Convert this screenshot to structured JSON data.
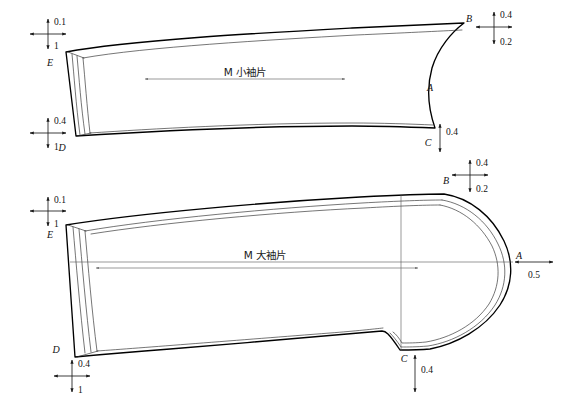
{
  "document": {
    "type": "garment-pattern-technical-drawing",
    "title": "Sleeve pattern grading diagram",
    "background_color": "#ffffff",
    "line_color": "#000000",
    "width": 567,
    "height": 404
  },
  "patterns": [
    {
      "id": "upper",
      "name": "M 小袖片",
      "label": "M 小袖片",
      "label_text": "M 小袖片",
      "size_prefix": "M",
      "piece_name": "小袖片",
      "points": [
        {
          "key": "E",
          "label": "E"
        },
        {
          "key": "D",
          "label": "D"
        },
        {
          "key": "B",
          "label": "B"
        },
        {
          "key": "A",
          "label": "A"
        },
        {
          "key": "C",
          "label": "C"
        }
      ],
      "dimensions": [
        {
          "at": "E",
          "vertical_top": "0.1",
          "vertical_bottom": "1",
          "kind": "cross"
        },
        {
          "at": "D",
          "vertical_top": "0.4",
          "vertical_bottom": "1",
          "kind": "cross"
        },
        {
          "at": "B",
          "vertical_top": "0.4",
          "vertical_bottom": "0.2",
          "kind": "cross"
        },
        {
          "at": "C",
          "vertical_top": "0.4",
          "kind": "vertical"
        }
      ]
    },
    {
      "id": "lower",
      "name": "M 大袖片",
      "label": "M 大袖片",
      "label_text": "M 大袖片",
      "size_prefix": "M",
      "piece_name": "大袖片",
      "points": [
        {
          "key": "E",
          "label": "E"
        },
        {
          "key": "D",
          "label": "D"
        },
        {
          "key": "B",
          "label": "B"
        },
        {
          "key": "A",
          "label": "A"
        },
        {
          "key": "C",
          "label": "C"
        }
      ],
      "dimensions": [
        {
          "at": "E",
          "vertical_top": "0.1",
          "vertical_bottom": "1",
          "kind": "cross"
        },
        {
          "at": "D",
          "vertical_top": "0.4",
          "vertical_bottom": "1",
          "kind": "cross"
        },
        {
          "at": "B",
          "vertical_top": "0.4",
          "vertical_bottom": "0.2",
          "kind": "cross"
        },
        {
          "at": "A",
          "horizontal": "0.5",
          "kind": "horizontal"
        },
        {
          "at": "C",
          "vertical_top": "0.4",
          "kind": "vertical"
        }
      ]
    }
  ],
  "annotations": {
    "upper": {
      "piece_label": "M 小袖片",
      "pt_E": "E",
      "pt_D": "D",
      "pt_B": "B",
      "pt_A": "A",
      "pt_C": "C",
      "dim_E_up": "0.1",
      "dim_E_down": "1",
      "dim_D_up": "0.4",
      "dim_D_down": "1",
      "dim_B_up": "0.4",
      "dim_B_down": "0.2",
      "dim_C_up": "0.4"
    },
    "lower": {
      "piece_label": "M 大袖片",
      "pt_E": "E",
      "pt_D": "D",
      "pt_B": "B",
      "pt_A": "A",
      "pt_C": "C",
      "dim_E_up": "0.1",
      "dim_E_down": "1",
      "dim_D_up": "0.4",
      "dim_D_down": "1",
      "dim_B_up": "0.4",
      "dim_B_down": "0.2",
      "dim_A_right": "0.5",
      "dim_C_down": "0.4"
    }
  }
}
